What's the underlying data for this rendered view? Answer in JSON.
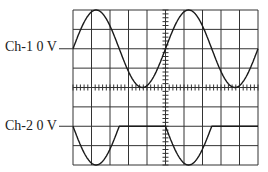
{
  "figure": {
    "type": "oscilloscope-display",
    "grid": {
      "h_divisions": 10,
      "v_divisions": 8,
      "minor_ticks_per_div": 5
    },
    "channels": [
      {
        "name": "Ch-1",
        "label": "Ch-1 0 V",
        "zero_level_div_from_top": 2,
        "waveform": "sine",
        "amplitude_div": 2,
        "period_div": 5
      },
      {
        "name": "Ch-2",
        "label": "Ch-2 0 V",
        "zero_level_div_from_top": 6,
        "waveform": "negative half-wave rectified sine",
        "amplitude_div": 2,
        "period_div": 5
      }
    ],
    "colors": {
      "trace": "#1a1a1a",
      "grid": "#333333",
      "background": "#ffffff"
    }
  }
}
